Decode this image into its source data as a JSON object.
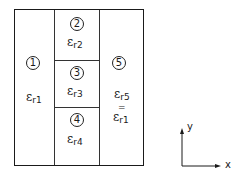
{
  "diagram": {
    "regions": [
      {
        "id": "1",
        "label": "1",
        "eps_symbol": "ε",
        "eps_sub": "r1"
      },
      {
        "id": "2",
        "label": "2",
        "eps_symbol": "ε",
        "eps_sub": "r2"
      },
      {
        "id": "3",
        "label": "3",
        "eps_symbol": "ε",
        "eps_sub": "r3"
      },
      {
        "id": "4",
        "label": "4",
        "eps_symbol": "ε",
        "eps_sub": "r4"
      },
      {
        "id": "5",
        "label": "5",
        "eps_symbol": "ε",
        "eps_sub": "r5",
        "equals": "=",
        "eq_symbol": "ε",
        "eq_sub": "r1"
      }
    ],
    "axes": {
      "x_label": "x",
      "y_label": "y"
    },
    "colors": {
      "line": "#1a1a1a",
      "background": "#ffffff"
    }
  }
}
